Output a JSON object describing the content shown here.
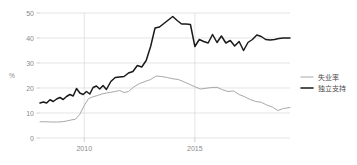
{
  "chart_data": {
    "type": "line",
    "title": "",
    "xlabel": "",
    "ylabel": "%",
    "ylim": [
      0,
      50
    ],
    "xlim": [
      2008.0,
      2019.3
    ],
    "yticks": [
      0,
      10,
      20,
      30,
      40,
      50
    ],
    "ytick_labels": [
      "0",
      "10",
      "20",
      "30",
      "40",
      "50"
    ],
    "xticks": [
      2010,
      2015
    ],
    "xtick_labels": [
      "2010",
      "2015"
    ],
    "grid": true,
    "legend_position": "right",
    "series": [
      {
        "name": "失业率",
        "color": "#a8a8a8",
        "x": [
          2008.0,
          2008.25,
          2008.5,
          2008.75,
          2009.0,
          2009.2,
          2009.4,
          2009.6,
          2009.8,
          2010.0,
          2010.2,
          2010.4,
          2010.6,
          2010.8,
          2011.0,
          2011.2,
          2011.4,
          2011.6,
          2011.8,
          2012.0,
          2012.25,
          2012.5,
          2012.75,
          2013.0,
          2013.25,
          2013.5,
          2013.75,
          2014.0,
          2014.25,
          2014.5,
          2014.75,
          2015.0,
          2015.25,
          2015.5,
          2015.75,
          2016.0,
          2016.25,
          2016.5,
          2016.75,
          2017.0,
          2017.25,
          2017.5,
          2017.75,
          2018.0,
          2018.25,
          2018.5,
          2018.75,
          2019.0,
          2019.3
        ],
        "values": [
          6.5,
          6.5,
          6.4,
          6.4,
          6.5,
          6.8,
          7.2,
          7.5,
          9.5,
          13.0,
          15.8,
          16.5,
          17.0,
          17.6,
          18.0,
          18.3,
          18.6,
          19.0,
          18.2,
          18.6,
          20.5,
          21.8,
          22.6,
          23.4,
          24.8,
          24.6,
          24.2,
          23.7,
          23.4,
          22.5,
          21.5,
          20.5,
          19.6,
          19.9,
          20.2,
          20.3,
          19.3,
          18.6,
          18.8,
          17.4,
          16.5,
          15.4,
          14.6,
          14.3,
          13.2,
          12.4,
          11.0,
          11.8,
          12.2
        ]
      },
      {
        "name": "独立支持",
        "color": "#1a1a1a",
        "x": [
          2008.0,
          2008.15,
          2008.3,
          2008.45,
          2008.6,
          2008.75,
          2008.9,
          2009.05,
          2009.2,
          2009.35,
          2009.5,
          2009.65,
          2009.8,
          2009.95,
          2010.1,
          2010.25,
          2010.4,
          2010.55,
          2010.7,
          2010.85,
          2011.0,
          2011.2,
          2011.4,
          2011.6,
          2011.8,
          2012.0,
          2012.2,
          2012.4,
          2012.6,
          2012.8,
          2013.0,
          2013.2,
          2013.4,
          2013.6,
          2013.8,
          2014.0,
          2014.2,
          2014.4,
          2014.6,
          2014.8,
          2015.0,
          2015.2,
          2015.4,
          2015.6,
          2015.8,
          2016.0,
          2016.2,
          2016.4,
          2016.6,
          2016.8,
          2017.0,
          2017.2,
          2017.4,
          2017.6,
          2017.8,
          2018.0,
          2018.2,
          2018.4,
          2018.6,
          2018.8,
          2019.0,
          2019.3
        ],
        "values": [
          14.0,
          14.4,
          14.0,
          15.3,
          14.6,
          15.6,
          16.2,
          15.4,
          16.6,
          17.4,
          16.8,
          19.8,
          18.0,
          17.4,
          18.6,
          17.6,
          20.2,
          20.8,
          19.6,
          21.0,
          19.4,
          22.6,
          24.2,
          24.4,
          24.6,
          26.0,
          26.6,
          29.0,
          28.4,
          31.0,
          36.6,
          44.0,
          44.4,
          45.8,
          47.2,
          48.6,
          47.0,
          45.6,
          45.6,
          45.4,
          36.6,
          39.4,
          38.6,
          38.0,
          41.4,
          38.2,
          40.8,
          38.0,
          39.0,
          36.8,
          38.6,
          35.0,
          38.2,
          39.4,
          41.2,
          40.6,
          39.4,
          39.2,
          39.4,
          39.8,
          40.0,
          40.0
        ]
      }
    ],
    "legend": [
      {
        "label": "失业率",
        "color": "#a8a8a8"
      },
      {
        "label": "独立支持",
        "color": "#1a1a1a"
      }
    ]
  }
}
